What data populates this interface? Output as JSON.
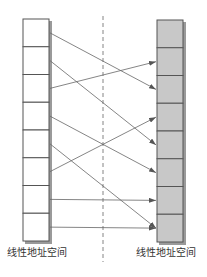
{
  "diagram": {
    "left_space": {
      "label": "线性地址空间",
      "cells": 8,
      "fill": "#ffffff"
    },
    "right_space": {
      "label": "线性地址空间",
      "cells": 8,
      "fill": "#c8c8c8"
    },
    "divider": "dashed vertical separator",
    "mappings": [
      {
        "from": 0,
        "to": 2
      },
      {
        "from": 1,
        "to": 4
      },
      {
        "from": 2,
        "to": 1
      },
      {
        "from": 3,
        "to": 5
      },
      {
        "from": 4,
        "to": 7
      },
      {
        "from": 5,
        "to": 3
      },
      {
        "from": 6,
        "to": 6
      },
      {
        "from": 7,
        "to": 7
      }
    ],
    "colors": {
      "stroke": "#555555",
      "shadow": "#9a9a9a",
      "arrow": "#666666",
      "right_fill": "#c8c8c8"
    }
  }
}
